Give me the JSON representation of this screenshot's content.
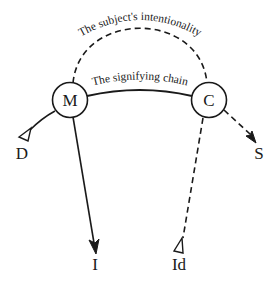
{
  "diagram": {
    "type": "graph-of-desire",
    "nodes": [
      {
        "id": "M",
        "label": "M",
        "shape": "circle"
      },
      {
        "id": "C",
        "label": "C",
        "shape": "circle"
      }
    ],
    "endpoints": [
      {
        "id": "D",
        "label": "D",
        "marker": "open-triangle"
      },
      {
        "id": "I",
        "label": "I",
        "marker": "filled-arrow"
      },
      {
        "id": "Id",
        "label": "Id",
        "marker": "open-triangle"
      },
      {
        "id": "S",
        "label": "S",
        "marker": "filled-arrow"
      }
    ],
    "edges": [
      {
        "from": "M",
        "to": "C",
        "style": "dashed",
        "label": "The subject's intentionality",
        "shape": "high-arc"
      },
      {
        "from": "M",
        "to": "C",
        "style": "solid",
        "label": "The signifying chain",
        "shape": "low-arc"
      },
      {
        "from": "M",
        "to": "D",
        "style": "solid",
        "label": ""
      },
      {
        "from": "M",
        "to": "I",
        "style": "solid",
        "label": ""
      },
      {
        "from": "C",
        "to": "Id",
        "style": "dashed",
        "label": ""
      },
      {
        "from": "C",
        "to": "S",
        "style": "dashed",
        "label": ""
      }
    ],
    "labels": {
      "intentionality": "The subject's intentionality",
      "signifying_chain": "The signifying chain",
      "M": "M",
      "C": "C",
      "D": "D",
      "I": "I",
      "Id": "Id",
      "S": "S"
    },
    "colors": {
      "stroke": "#1a1a1a",
      "background": "#ffffff"
    }
  }
}
